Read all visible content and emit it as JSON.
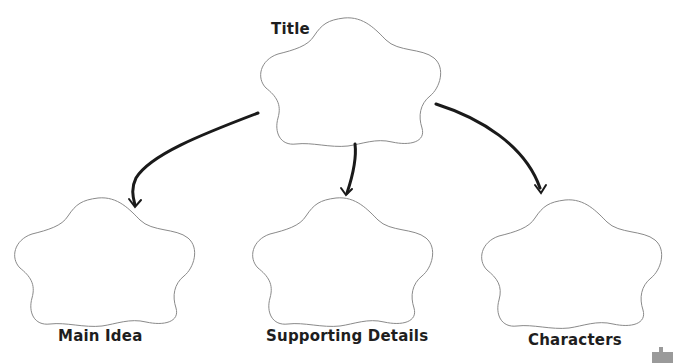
{
  "diagram": {
    "type": "graphic-organizer",
    "colors": {
      "outline": "#8a8a8a",
      "arrow": "#1a1a1a",
      "text": "#1e1e1e",
      "background": "#ffffff"
    },
    "top_node": {
      "label": "Title"
    },
    "child_nodes": [
      {
        "label": "Main Idea"
      },
      {
        "label": "Supporting Details"
      },
      {
        "label": "Characters"
      }
    ],
    "edges": [
      {
        "from": "Title",
        "to": "Main Idea"
      },
      {
        "from": "Title",
        "to": "Supporting Details"
      },
      {
        "from": "Title",
        "to": "Characters"
      }
    ]
  }
}
